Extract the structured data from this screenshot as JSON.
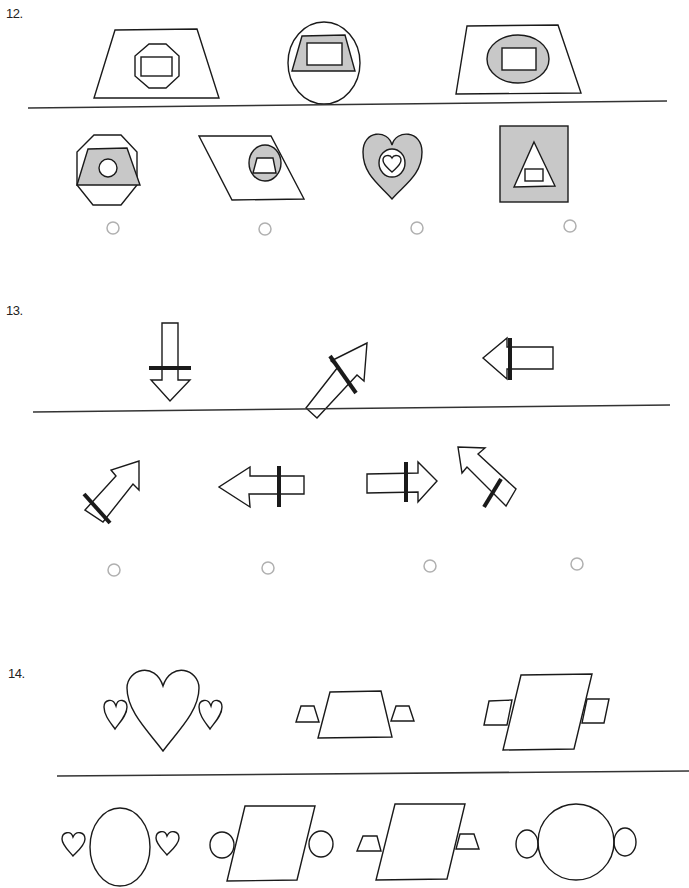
{
  "questions": [
    {
      "number": "12.",
      "prompt_figures": [
        {
          "id": "q12-p1",
          "description": "trapezoid containing octagon containing rectangle"
        },
        {
          "id": "q12-p2",
          "description": "circle containing shaded trapezoid containing rectangle"
        },
        {
          "id": "q12-p3",
          "description": "trapezoid containing shaded circle containing rectangle"
        }
      ],
      "options": [
        {
          "id": "q12-o1",
          "description": "octagon containing shaded trapezoid containing circle",
          "selected": false
        },
        {
          "id": "q12-o2",
          "description": "parallelogram containing shaded circle containing trapezoid",
          "selected": false
        },
        {
          "id": "q12-o3",
          "description": "shaded heart containing circle containing heart",
          "selected": false
        },
        {
          "id": "q12-o4",
          "description": "shaded square containing triangle containing rectangle",
          "selected": false
        }
      ]
    },
    {
      "number": "13.",
      "prompt_figures": [
        {
          "id": "q13-p1",
          "description": "arrow pointing down with crossbar"
        },
        {
          "id": "q13-p2",
          "description": "arrow pointing up-right with crossbar"
        },
        {
          "id": "q13-p3",
          "description": "arrow pointing left with crossbar"
        }
      ],
      "options": [
        {
          "id": "q13-o1",
          "description": "arrow pointing up-right with crossbar near tail",
          "selected": false
        },
        {
          "id": "q13-o2",
          "description": "arrow pointing left with crossbar near tail",
          "selected": false
        },
        {
          "id": "q13-o3",
          "description": "arrow pointing right with crossbar near head",
          "selected": false
        },
        {
          "id": "q13-o4",
          "description": "arrow pointing up-left with crossbar near tail",
          "selected": false
        }
      ]
    },
    {
      "number": "14.",
      "prompt_figures": [
        {
          "id": "q14-p1",
          "description": "large heart flanked by two small hearts"
        },
        {
          "id": "q14-p2",
          "description": "trapezoid flanked by two small trapezoids"
        },
        {
          "id": "q14-p3",
          "description": "parallelogram flanked by two small parallelograms"
        }
      ],
      "options": [
        {
          "id": "q14-o1",
          "description": "oval flanked by two small hearts",
          "selected": false
        },
        {
          "id": "q14-o2",
          "description": "parallelogram flanked by two small circles",
          "selected": false
        },
        {
          "id": "q14-o3",
          "description": "parallelogram flanked by two small trapezoids",
          "selected": false
        },
        {
          "id": "q14-o4",
          "description": "circle flanked by two small ovals",
          "selected": false
        }
      ]
    }
  ],
  "colors": {
    "stroke": "#1a1a1a",
    "shade": "#c8c8c8",
    "radio": "#b0b0b0",
    "divider": "#333333"
  }
}
